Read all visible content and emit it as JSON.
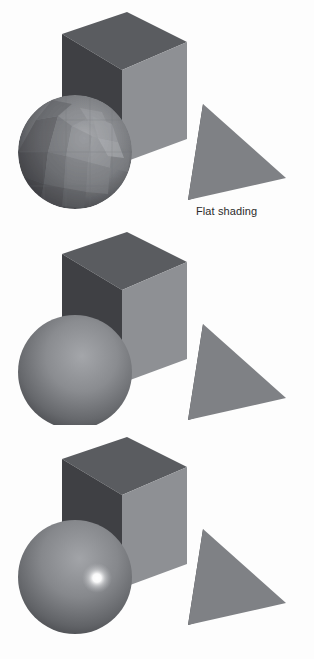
{
  "figure": {
    "background_color": "#fdfdfd",
    "text_color": "#2b2b2b",
    "width": 314,
    "height": 659
  },
  "palette": {
    "cube_left_face": "#3f4044",
    "cube_top_face": "#5a5c60",
    "cube_right_face": "#8e9094",
    "pyramid_left_face": "#3d3e42",
    "pyramid_right_face": "#7f8185",
    "sphere_light": "#a8aaae",
    "sphere_mid": "#76787c",
    "sphere_dark": "#3c3d41",
    "specular_highlight": "#ffffff"
  },
  "panels": [
    {
      "id": "flat",
      "caption": "Flat shading",
      "shading_model": "flat",
      "sphere": {
        "name": "sphere",
        "faceted": true,
        "facet_rows": 9,
        "facet_cols": 16,
        "specular": false,
        "center_x": 75,
        "center_y": 152,
        "radius": 57
      },
      "cube": {
        "name": "cube",
        "faces": [
          "left",
          "top",
          "right"
        ],
        "specular": false
      },
      "pyramid": {
        "name": "pyramid",
        "faces": [
          "left",
          "right"
        ],
        "specular": false
      }
    },
    {
      "id": "gouraud",
      "caption": "Gouraud shading",
      "shading_model": "gouraud",
      "sphere": {
        "name": "sphere",
        "faceted": false,
        "specular": false,
        "center_x": 75,
        "center_y": 152,
        "radius": 57
      },
      "cube": {
        "name": "cube",
        "faces": [
          "left",
          "top",
          "right"
        ],
        "specular": false
      },
      "pyramid": {
        "name": "pyramid",
        "faces": [
          "left",
          "right"
        ],
        "specular": false
      }
    },
    {
      "id": "phong",
      "caption": "Phong shading",
      "shading_model": "phong",
      "sphere": {
        "name": "sphere",
        "faceted": false,
        "specular": true,
        "specular_x": 97,
        "specular_y": 153,
        "specular_radius": 13,
        "center_x": 75,
        "center_y": 152,
        "radius": 57
      },
      "cube": {
        "name": "cube",
        "faces": [
          "left",
          "top",
          "right"
        ],
        "specular": false
      },
      "pyramid": {
        "name": "pyramid",
        "faces": [
          "left",
          "right"
        ],
        "specular": false
      }
    }
  ]
}
